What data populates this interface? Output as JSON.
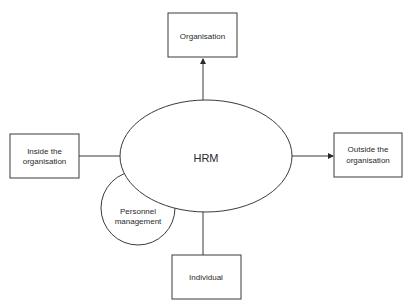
{
  "diagram": {
    "center": {
      "label": "HRM"
    },
    "nodes": {
      "top": {
        "label": "Organisation"
      },
      "left": {
        "lines": [
          "Inside the",
          "organisation"
        ]
      },
      "right": {
        "lines": [
          "Outside the",
          "organisation"
        ]
      },
      "bottom": {
        "label": "Individual"
      },
      "overlap": {
        "lines": [
          "Personnel",
          "management"
        ]
      }
    },
    "colors": {
      "stroke": "#3a3a3a",
      "text": "#2a2a2a",
      "background": "#ffffff"
    }
  }
}
